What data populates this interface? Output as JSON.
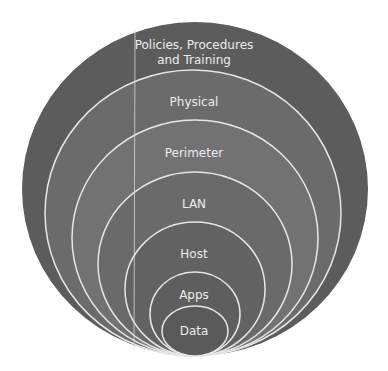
{
  "diagram": {
    "type": "nested-concentric-layers",
    "layers": [
      {
        "label_line1": "Policies, Procedures",
        "label_line2": "and Training",
        "color": "#5c5c5c"
      },
      {
        "label": "Physical",
        "color": "#6b6b6b"
      },
      {
        "label": "Perimeter",
        "color": "#727272"
      },
      {
        "label": "LAN",
        "color": "#6a6a6a"
      },
      {
        "label": "Host",
        "color": "#626262"
      },
      {
        "label": "Apps",
        "color": "#5e5e5e"
      },
      {
        "label": "Data",
        "color": "#5a5a5a"
      }
    ],
    "ring_stroke": "#e6e6e6"
  }
}
